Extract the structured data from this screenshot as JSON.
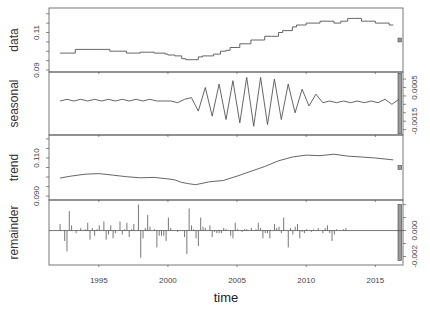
{
  "chart_data": {
    "type": "line",
    "title": "",
    "xlabel": "time",
    "x_ticks": [
      1995,
      2000,
      2005,
      2010,
      2015
    ],
    "xlim": [
      1991.4,
      2017.0
    ],
    "panels": [
      {
        "name": "data",
        "ylabel": "data",
        "kind": "step",
        "ylim": [
          0.09,
          0.122
        ],
        "y_tick_labels": [
          {
            "v": 0.09,
            "t": "0.09"
          },
          {
            "v": 0.11,
            "t": "0.11"
          }
        ],
        "y_minor_ticks": [
          0.095,
          0.1,
          0.105,
          0.115,
          0.12
        ],
        "axis_side": "left",
        "range_bar": {
          "height_frac": 0.06
        },
        "x": [
          1992.2,
          1993.0,
          1993.3,
          1994.5,
          1995.0,
          1995.8,
          1996.3,
          1997.0,
          1997.8,
          1998.0,
          1998.8,
          1999.0,
          1999.8,
          2000.0,
          2000.5,
          2001.0,
          2001.3,
          2001.8,
          2002.2,
          2002.5,
          2003.0,
          2003.3,
          2003.8,
          2004.2,
          2004.5,
          2005.0,
          2005.2,
          2005.8,
          2006.0,
          2006.5,
          2007.0,
          2007.5,
          2008.0,
          2008.3,
          2009.0,
          2009.3,
          2010.0,
          2010.5,
          2011.0,
          2011.5,
          2012.0,
          2012.5,
          2013.0,
          2013.5,
          2014.0,
          2014.5,
          2015.0,
          2015.5,
          2016.0,
          2016.3
        ],
        "values": [
          0.099,
          0.099,
          0.101,
          0.101,
          0.101,
          0.1,
          0.1,
          0.099,
          0.099,
          0.0995,
          0.0995,
          0.099,
          0.0985,
          0.098,
          0.0975,
          0.096,
          0.0955,
          0.0955,
          0.097,
          0.0975,
          0.0975,
          0.0985,
          0.1,
          0.1005,
          0.102,
          0.102,
          0.104,
          0.104,
          0.106,
          0.106,
          0.108,
          0.108,
          0.11,
          0.111,
          0.113,
          0.114,
          0.115,
          0.115,
          0.116,
          0.116,
          0.115,
          0.116,
          0.1175,
          0.1175,
          0.116,
          0.116,
          0.115,
          0.115,
          0.114,
          0.114
        ]
      },
      {
        "name": "seasonal",
        "ylabel": "seasonal",
        "kind": "line",
        "ylim": [
          -0.0022,
          0.0013
        ],
        "y_tick_labels": [
          {
            "v": 0.0005,
            "t": "0.0005"
          },
          {
            "v": -0.0015,
            "t": "-0.0015"
          }
        ],
        "y_minor_ticks": [
          0.001,
          0.0,
          -0.0005,
          -0.001,
          -0.002
        ],
        "axis_side": "right",
        "range_bar": {
          "height_frac": 0.96
        },
        "x_start": 1992.2,
        "x_step": 0.5,
        "values": [
          -0.0003,
          -0.0002,
          -0.0003,
          -0.0002,
          -0.0003,
          -0.0002,
          -0.0003,
          -0.0002,
          -0.0003,
          -0.0002,
          -0.0003,
          -0.0002,
          -0.0003,
          -0.0002,
          -0.0003,
          -0.0003,
          -0.0003,
          -0.0004,
          -0.0002,
          -0.0001,
          -0.0009,
          0.0005,
          -0.0012,
          0.0007,
          -0.0014,
          0.0009,
          -0.0016,
          0.0011,
          -0.0018,
          0.0011,
          -0.0017,
          0.001,
          -0.0014,
          0.0007,
          -0.001,
          0.0004,
          -0.0006,
          0.0001,
          -0.0004,
          -0.0003,
          -0.0004,
          -0.0003,
          -0.0004,
          -0.0003,
          -0.0004,
          -0.0003,
          -0.0004,
          -0.0002,
          -0.0005,
          -0.0002
        ]
      },
      {
        "name": "trend",
        "ylabel": "trend",
        "kind": "line",
        "ylim": [
          0.089,
          0.121
        ],
        "y_tick_labels": [
          {
            "v": 0.09,
            "t": "0.090"
          },
          {
            "v": 0.11,
            "t": "0.110"
          }
        ],
        "y_minor_ticks": [
          0.095,
          0.1,
          0.105,
          0.115,
          0.12
        ],
        "axis_side": "left",
        "range_bar": {
          "height_frac": 0.06
        },
        "x": [
          1992.2,
          1993.0,
          1994.0,
          1995.0,
          1996.0,
          1997.0,
          1998.0,
          1999.0,
          2000.0,
          2000.5,
          2001.0,
          2001.5,
          2002.0,
          2003.0,
          2004.0,
          2005.0,
          2006.0,
          2007.0,
          2008.0,
          2009.0,
          2010.0,
          2011.0,
          2012.0,
          2013.0,
          2014.0,
          2015.0,
          2016.3
        ],
        "values": [
          0.0995,
          0.1005,
          0.1015,
          0.1018,
          0.101,
          0.1002,
          0.0996,
          0.0998,
          0.099,
          0.0985,
          0.0972,
          0.0965,
          0.096,
          0.0975,
          0.0982,
          0.1005,
          0.103,
          0.1055,
          0.1085,
          0.1105,
          0.1115,
          0.1112,
          0.112,
          0.111,
          0.1105,
          0.11,
          0.109
        ]
      },
      {
        "name": "remainder",
        "ylabel": "remainder",
        "kind": "spikes",
        "ylim": [
          -0.0025,
          0.0022
        ],
        "y_tick_labels": [
          {
            "v": 0.0,
            "t": "0.000"
          },
          {
            "v": -0.002,
            "t": "-0.002"
          }
        ],
        "y_minor_ticks": [
          0.002,
          0.001,
          -0.001
        ],
        "axis_side": "right",
        "range_bar": {
          "height_frac": 0.86
        },
        "x_start": 1992.2,
        "x_step": 0.1667,
        "values": [
          0.0005,
          0,
          -0.0008,
          -0.0016,
          0.0015,
          0.0004,
          0,
          -0.0002,
          0,
          0.0002,
          0,
          0.0001,
          0.0006,
          -0.0007,
          0.0002,
          -0.0004,
          0.0001,
          0.0004,
          0,
          0.0007,
          -0.0007,
          -0.0003,
          0.0004,
          -0.0006,
          -0.0002,
          0,
          0.0007,
          -0.0003,
          0.0001,
          0.0006,
          -0.0005,
          0.0001,
          0.0005,
          0,
          0.002,
          -0.0021,
          -0.0006,
          0.0002,
          0.0012,
          0.0003,
          0,
          0.0001,
          -0.0013,
          -0.0004,
          -0.0004,
          -0.0004,
          -0.0008,
          0.001,
          0.0002,
          0,
          0,
          -0.0001,
          0,
          0,
          -0.0005,
          -0.0018,
          0.0017,
          0.0004,
          0.0001,
          -0.0006,
          -0.0012,
          0.001,
          0.0003,
          0.0002,
          0,
          0.0004,
          -0.0005,
          -0.0001,
          -0.0002,
          -0.0002,
          -0.0002,
          0.0002,
          0.0001,
          0,
          -0.0004,
          -0.0006,
          0.0006,
          0.0001,
          0,
          -0.0001,
          0.0001,
          0.0001,
          0,
          0.0002,
          0,
          0.0001,
          0.0006,
          0.0002,
          -0.0006,
          -0.0002,
          -0.0002,
          -0.0006,
          0,
          0.0005,
          0.0002,
          0.0003,
          -0.0002,
          0.001,
          0,
          -0.0013,
          0.0002,
          -0.0003,
          0.0003,
          0.0005,
          -0.0006,
          -0.0001,
          -0.0002,
          0.0001,
          0,
          -0.0001,
          0.0001,
          0,
          0.0002,
          0,
          -0.0002,
          0.0002,
          0.0004,
          -0.0002,
          -0.0008,
          -0.0003,
          0.0001,
          0,
          0,
          0.0001,
          0.0002
        ]
      }
    ],
    "colors": {
      "line": "#555555",
      "frame": "#555555",
      "bar_fill": "#9a9a9a",
      "text": "#333333"
    }
  }
}
